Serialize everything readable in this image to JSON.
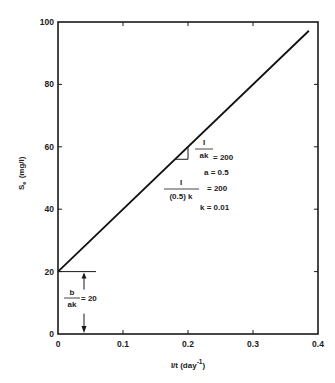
{
  "chart_data": {
    "type": "line",
    "title": "",
    "xlabel": "I/t (day⁻¹)",
    "xlabel_parts": {
      "main": "I/t (day",
      "sup": "-1",
      "close": ")"
    },
    "ylabel": "Se (mg/l)",
    "ylabel_parts": {
      "main": "S",
      "sub": "e",
      "units": "(mg/l)"
    },
    "xlim": [
      0,
      0.4
    ],
    "ylim": [
      0,
      100
    ],
    "grid": false,
    "legend": null,
    "x_ticks": [
      0,
      0.1,
      0.2,
      0.3,
      0.4
    ],
    "x_tick_labels": [
      "0",
      "0.1",
      "0.2",
      "0.3",
      "0.4"
    ],
    "y_ticks": [
      0,
      20,
      40,
      60,
      80,
      100
    ],
    "y_tick_labels": [
      "0",
      "20",
      "40",
      "60",
      "80",
      "100"
    ],
    "series": [
      {
        "name": "Se vs 1/t",
        "x": [
          0,
          0.386
        ],
        "y": [
          20,
          97.2
        ],
        "intercept": 20,
        "slope": 200
      }
    ],
    "annotations": {
      "slope": {
        "frac1_num": "I",
        "frac1_den": "ak",
        "frac1_val": "= 200",
        "a": "a = 0.5",
        "frac2_num": "I",
        "frac2_den": "(0.5) k",
        "frac2_val": "= 200",
        "k": "k = 0.01"
      },
      "intercept": {
        "num": "b",
        "den": "ak",
        "val": "= 20"
      }
    }
  }
}
